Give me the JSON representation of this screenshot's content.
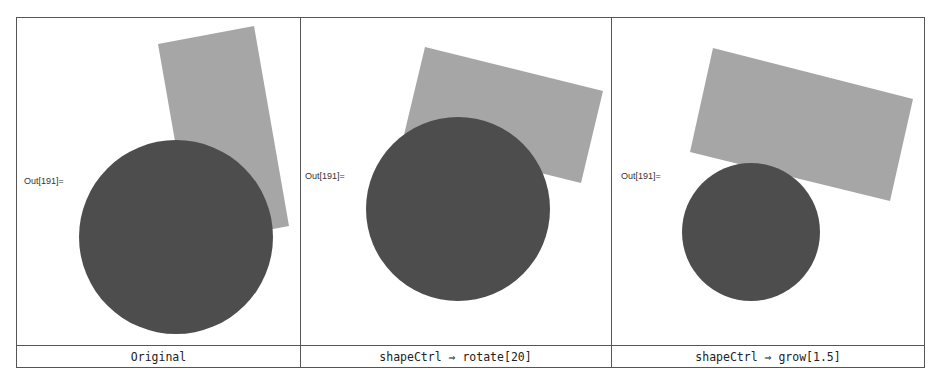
{
  "panels": [
    {
      "out_label": "Out[191]=",
      "caption": "Original",
      "rect_points": "158,44 254,26 289,226 193,244",
      "circle": {
        "cx": 176,
        "cy": 237,
        "r": 97
      }
    },
    {
      "out_label": "Out[191]=",
      "caption": "shapeCtrl ⇒ rotate[20]",
      "rect_points": "425,47 603,91 581,183 403,139",
      "circle": {
        "cx": 458,
        "cy": 209,
        "r": 92
      }
    },
    {
      "out_label": "Out[191]=",
      "caption": "shapeCtrl ⇒ grow[1.5]",
      "rect_points": "713,48 913,99 890,201 690,152",
      "circle": {
        "cx": 751,
        "cy": 232,
        "r": 69
      }
    }
  ],
  "colors": {
    "rect_fill": "#a6a6a6",
    "circle_fill": "#4d4d4d",
    "border": "#555555"
  }
}
